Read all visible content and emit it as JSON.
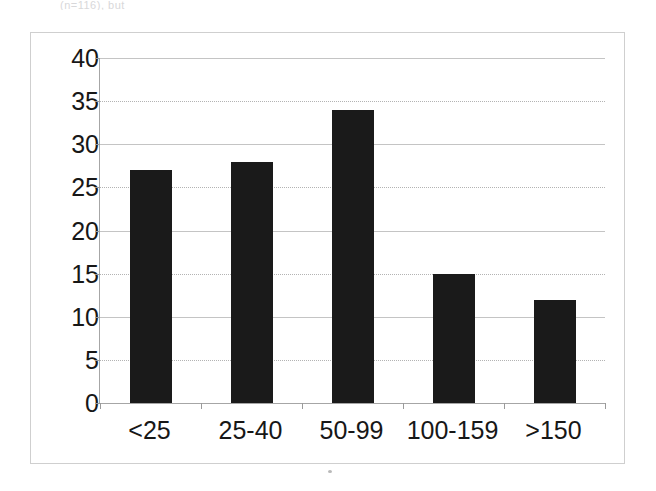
{
  "document": {
    "top_cut_text": "(n=116), but",
    "background_color": "#ffffff"
  },
  "chart": {
    "frame_border_color": "#cfcfcf",
    "axis_color": "#a6a6a6",
    "gridline_color": "#b3b3b3",
    "bar_color": "#1a1a1a",
    "text_color": "#171717"
  },
  "chart_data": {
    "type": "bar",
    "title": "",
    "subtitle": "",
    "xlabel": "",
    "ylabel": "",
    "categories": [
      "<25",
      "25-40",
      "50-99",
      "100-159",
      ">150"
    ],
    "values": [
      27,
      28,
      34,
      15,
      12
    ],
    "ylim": [
      0,
      40
    ],
    "ytick_step": 5,
    "yticks": [
      0,
      5,
      10,
      15,
      20,
      25,
      30,
      35,
      40
    ],
    "ytick_labels": [
      "0",
      "5",
      "10",
      "15",
      "20",
      "25",
      "30",
      "35",
      "40"
    ],
    "grid": true,
    "grid_axis": "y",
    "legend": false,
    "legend_position": "none",
    "series": [
      {
        "name": "",
        "values": [
          27,
          28,
          34,
          15,
          12
        ]
      }
    ]
  }
}
